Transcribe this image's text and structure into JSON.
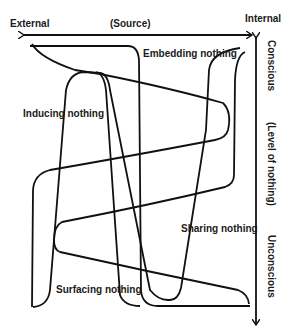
{
  "axes": {
    "horizontal": {
      "left_label": "External",
      "center_label": "(Source)",
      "right_label": "Internal"
    },
    "vertical": {
      "top_label": "Conscious",
      "center_label": "(Level of nothing)",
      "bottom_label": "Unconscious"
    }
  },
  "curves": [
    {
      "label": "Embedding nothing"
    },
    {
      "label": "Inducing nothing"
    },
    {
      "label": "Sharing nothing"
    },
    {
      "label": "Surfacing nothing"
    }
  ],
  "colors": {
    "stroke": "#111111",
    "background": "#ffffff",
    "text": "#1a1a1a"
  }
}
